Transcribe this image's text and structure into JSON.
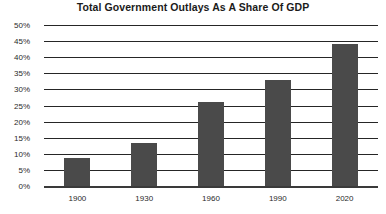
{
  "chart_data": {
    "type": "bar",
    "title": "Total Government Outlays As A Share Of GDP",
    "xlabel": "",
    "ylabel": "",
    "categories": [
      "1900",
      "1930",
      "1960",
      "1990",
      "2020"
    ],
    "values": [
      8.7,
      13.3,
      26,
      33,
      44
    ],
    "value_labels": [
      "8.7%",
      "13.3%",
      "26%",
      "33%",
      "44%"
    ],
    "ylim": [
      0,
      50
    ],
    "ytick_values": [
      0,
      5,
      10,
      15,
      20,
      25,
      30,
      35,
      40,
      45,
      50
    ],
    "ytick_labels": [
      "0%",
      "5%",
      "10%",
      "15%",
      "20%",
      "25%",
      "30%",
      "35%",
      "40%",
      "45%",
      "50%"
    ],
    "grid": true,
    "grid_axis": "y",
    "legend": false,
    "legend_position": "none",
    "series": [
      {
        "name": "Total Government Outlays As A Share Of GDP",
        "values": [
          8.7,
          13.3,
          26,
          33,
          44
        ],
        "color": "#4a4a4a"
      }
    ],
    "colors": {
      "bar": "#4a4a4a",
      "gridline": "#262626",
      "axis": "#3a3a3a",
      "text": "#2a2a2a",
      "title": "#1b1b1b",
      "background": "#ffffff"
    }
  }
}
